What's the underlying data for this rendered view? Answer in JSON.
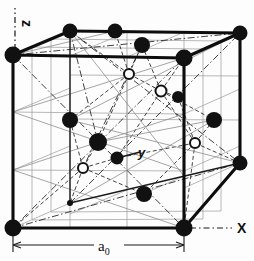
{
  "figure": {
    "type": "crystal-lattice-diagram",
    "background_color": "#fdfdfd",
    "line_color": "#111111",
    "atom_fill_color": "#111111",
    "atom_open_fill_color": "#ffffff",
    "interior_line_color": "#8a8a8a"
  },
  "axes": {
    "z": {
      "label": "z",
      "orientation": "vertical-up",
      "label_rotated": true
    },
    "x": {
      "label": "X",
      "orientation": "horizontal-right",
      "label_rotated": false
    },
    "y": {
      "label": "y",
      "orientation": "depth-back-right",
      "label_rotated": false
    }
  },
  "dimension": {
    "label": "a",
    "subscript": "0",
    "full_label": "a₀",
    "description": "lattice constant spanning cube front bottom edge"
  },
  "cube": {
    "front": {
      "top_left": [
        13,
        55
      ],
      "top_right": [
        184,
        58
      ],
      "bottom_right": [
        184,
        228
      ],
      "bottom_left": [
        13,
        228
      ]
    },
    "back": {
      "top_left": [
        70,
        31
      ],
      "top_right": [
        240,
        33
      ],
      "bottom_right": [
        240,
        163
      ],
      "bottom_left": [
        70,
        203
      ]
    }
  },
  "atoms": {
    "corner_label": "corner atom",
    "face_label": "face-center atom",
    "interior_label": "tetrahedral interior atom",
    "filled_radius": 8,
    "open_radius": 5.5,
    "filled": [
      {
        "name": "corner-front-top-left",
        "x": 13,
        "y": 55,
        "r": 8.5
      },
      {
        "name": "corner-front-top-right",
        "x": 184,
        "y": 58,
        "r": 8.5
      },
      {
        "name": "corner-front-bottom-left",
        "x": 13,
        "y": 228,
        "r": 8.5
      },
      {
        "name": "corner-front-bottom-right",
        "x": 184,
        "y": 228,
        "r": 8.5
      },
      {
        "name": "corner-back-top-left",
        "x": 70,
        "y": 31,
        "r": 7.5
      },
      {
        "name": "corner-back-top-right",
        "x": 240,
        "y": 33,
        "r": 7.5
      },
      {
        "name": "corner-back-bottom-right",
        "x": 240,
        "y": 163,
        "r": 7.5
      },
      {
        "name": "face-center-top",
        "x": 115,
        "y": 31,
        "r": 7.5
      },
      {
        "name": "face-center-back",
        "x": 142,
        "y": 45,
        "r": 8.0
      },
      {
        "name": "face-center-left",
        "x": 70,
        "y": 120,
        "r": 8.0
      },
      {
        "name": "face-center-right",
        "x": 214,
        "y": 120,
        "r": 8.0
      },
      {
        "name": "face-center-front",
        "x": 98,
        "y": 142,
        "r": 9.0
      },
      {
        "name": "face-center-interior-mid",
        "x": 117,
        "y": 158,
        "r": 6.5
      },
      {
        "name": "face-center-bottom",
        "x": 144,
        "y": 194,
        "r": 8.0
      },
      {
        "name": "corner-back-bottom-left",
        "x": 70,
        "y": 203,
        "r": 3.0
      },
      {
        "name": "face-center-upper-right",
        "x": 178,
        "y": 97,
        "r": 6.0
      }
    ],
    "open": [
      {
        "name": "interior-atom-upper-left",
        "x": 129,
        "y": 74,
        "r": 6.0
      },
      {
        "name": "interior-atom-upper-right",
        "x": 161,
        "y": 91,
        "r": 6.5
      },
      {
        "name": "interior-atom-lower-left",
        "x": 83,
        "y": 168,
        "r": 6.0
      },
      {
        "name": "interior-atom-lower-right",
        "x": 195,
        "y": 143,
        "r": 6.0
      }
    ]
  }
}
